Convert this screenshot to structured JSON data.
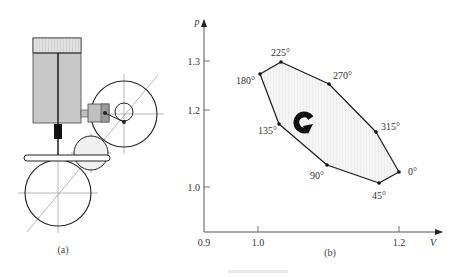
{
  "figure": {
    "panel_a": {
      "caption": "(a)",
      "elements": {
        "cylinder": {
          "x": 33,
          "y": 38,
          "w": 48,
          "h": 85,
          "head_h": 15,
          "fill": "#c8c8c8",
          "head_fill": "#dcdcdc"
        },
        "piston_rod": {
          "x": 58,
          "y1": 53,
          "y2": 156
        },
        "rod_block": {
          "x": 54,
          "y": 124,
          "w": 8,
          "h": 15,
          "fill": "#111111"
        },
        "slider_bar": {
          "x": 24,
          "y": 155,
          "w": 86,
          "h": 6
        },
        "small_piston": {
          "x": 88,
          "y": 104,
          "w": 21,
          "h": 18,
          "fill": "#bfbfbf"
        },
        "flywheel_right": {
          "cx": 124,
          "cy": 114,
          "r": 33
        },
        "crank_circle": {
          "cx": 124,
          "cy": 112,
          "r": 9
        },
        "crank_pin": {
          "cx": 124,
          "cy": 122
        },
        "wrist_pin": {
          "cx": 105,
          "cy": 113
        },
        "idler_gear": {
          "cx": 91,
          "cy": 153,
          "r": 17,
          "fill": "#f0f0f0"
        },
        "flywheel_bottom": {
          "cx": 58,
          "cy": 193,
          "r": 33
        },
        "diagonal": {
          "x1": 27,
          "y1": 232,
          "x2": 158,
          "y2": 75
        }
      }
    },
    "panel_b": {
      "caption": "(b)",
      "rotation_icon": "clockwise-arrow-icon"
    },
    "figure_caption": ""
  },
  "chart_data": {
    "type": "line",
    "title": "",
    "xlabel": "V",
    "ylabel": "p",
    "x_ticks": [
      0.9,
      1.0,
      1.2
    ],
    "y_ticks": [
      1.0,
      1.2,
      1.3
    ],
    "xlim": [
      0.9,
      1.25
    ],
    "ylim": [
      0.9,
      1.35
    ],
    "grid": false,
    "closed": true,
    "series": [
      {
        "name": "p-V cycle",
        "points": [
          {
            "label": "0°",
            "V": 1.2,
            "p": 1.03
          },
          {
            "label": "45°",
            "V": 1.17,
            "p": 1.01
          },
          {
            "label": "90°",
            "V": 1.09,
            "p": 1.04
          },
          {
            "label": "135°",
            "V": 1.04,
            "p": 1.13
          },
          {
            "label": "180°",
            "V": 1.0,
            "p": 1.27
          },
          {
            "label": "225°",
            "V": 1.04,
            "p": 1.3
          },
          {
            "label": "270°",
            "V": 1.09,
            "p": 1.25
          },
          {
            "label": "315°",
            "V": 1.16,
            "p": 1.15
          }
        ]
      }
    ],
    "annotations": [
      "clockwise rotation arrow inside cycle"
    ]
  },
  "plot_px": {
    "axis_origin": {
      "x": 204,
      "y": 232
    },
    "x_axis_end": 442,
    "y_axis_top": 20,
    "x_tick_px": {
      "0.9": 204,
      "1.0": 258,
      "1.2": 399
    },
    "y_tick_px": {
      "1.3": 61,
      "1.2": 110,
      "1.0": 187
    },
    "vertices_px": [
      {
        "label": "0°",
        "x": 399,
        "y": 172,
        "lx": 408,
        "ly": 175
      },
      {
        "label": "45°",
        "x": 379,
        "y": 183,
        "lx": 372,
        "ly": 199
      },
      {
        "label": "90°",
        "x": 327,
        "y": 165,
        "lx": 310,
        "ly": 179
      },
      {
        "label": "135°",
        "x": 279,
        "y": 124,
        "lx": 258,
        "ly": 134
      },
      {
        "label": "180°",
        "x": 260,
        "y": 74,
        "lx": 236,
        "ly": 84
      },
      {
        "label": "225°",
        "x": 281,
        "y": 62,
        "lx": 271,
        "ly": 56
      },
      {
        "label": "270°",
        "x": 329,
        "y": 84,
        "lx": 333,
        "ly": 79
      },
      {
        "label": "315°",
        "x": 376,
        "y": 132,
        "lx": 381,
        "ly": 130
      }
    ]
  }
}
